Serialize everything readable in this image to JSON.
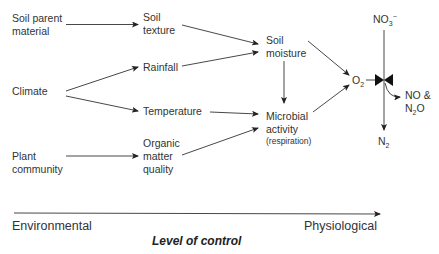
{
  "diagram": {
    "nodes": {
      "soil_parent_material": [
        "Soil parent",
        "material"
      ],
      "climate": [
        "Climate"
      ],
      "plant_community": [
        "Plant",
        "community"
      ],
      "soil_texture": [
        "Soil",
        "texture"
      ],
      "rainfall": [
        "Rainfall"
      ],
      "temperature": [
        "Temperature"
      ],
      "organic_matter_quality": [
        "Organic",
        "matter",
        "quality"
      ],
      "soil_moisture": [
        "Soil",
        "moisture"
      ],
      "microbial_activity": [
        "Microbial",
        "activity"
      ],
      "microbial_activity_note": "(respiration)",
      "o2": {
        "base": "O",
        "sub": "2"
      },
      "no3": {
        "base": "NO",
        "sub": "3",
        "sup": "−"
      },
      "no_n2o": {
        "line1": "NO &",
        "line2_base": "N",
        "line2_sub": "2",
        "line2_rest": "O"
      },
      "n2": {
        "base": "N",
        "sub": "2"
      }
    },
    "edges": [
      [
        "Soil parent material",
        "Soil texture"
      ],
      [
        "Climate",
        "Rainfall"
      ],
      [
        "Climate",
        "Temperature"
      ],
      [
        "Plant community",
        "Organic matter quality"
      ],
      [
        "Soil texture",
        "Soil moisture"
      ],
      [
        "Rainfall",
        "Soil moisture"
      ],
      [
        "Temperature",
        "Microbial activity"
      ],
      [
        "Organic matter quality",
        "Microbial activity"
      ],
      [
        "Soil moisture",
        "Microbial activity"
      ],
      [
        "Soil moisture",
        "O2"
      ],
      [
        "Microbial activity",
        "O2"
      ],
      [
        "O2",
        "valve"
      ],
      [
        "NO3-",
        "N2"
      ],
      [
        "valve",
        "NO & N2O"
      ]
    ],
    "axis": {
      "left_label": "Environmental",
      "right_label": "Physiological",
      "title": "Level of control"
    }
  }
}
